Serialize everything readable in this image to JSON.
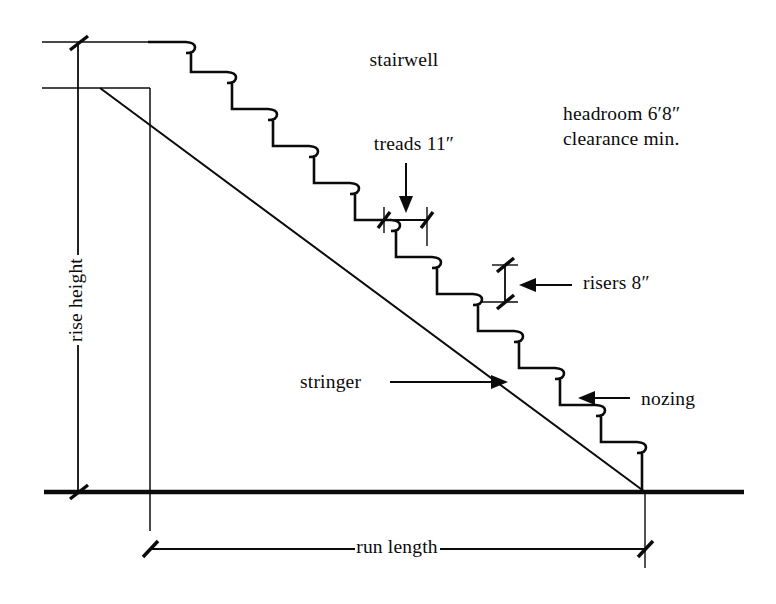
{
  "diagram": {
    "background_color": "#ffffff",
    "ink_color": "#0b0b0b"
  },
  "labels": {
    "stairwell": "stairwell",
    "headroom_line1": "headroom 6′8″",
    "headroom_line2": "clearance min.",
    "treads": "treads 11″",
    "risers": "risers 8″",
    "stringer": "stringer",
    "nozing": "nozing",
    "rise_height": "rise height",
    "run_length": "run length"
  },
  "measurements": {
    "headroom": "6′8″",
    "tread_depth": "11″",
    "riser_height": "8″"
  },
  "geometry": {
    "ground_y": 492,
    "stair_top_y": 42,
    "stair_start_x": 150,
    "stair_end_x": 645,
    "step_count": 12,
    "tread_run_px": 41,
    "riser_rise_px": 30,
    "nosing_overhang_px": 9,
    "rise_dim_x": 78,
    "run_dim_y": 549
  }
}
